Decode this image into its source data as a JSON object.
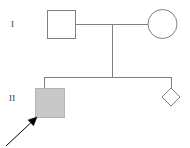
{
  "figure": {
    "kind": "pedigree-chart",
    "width": 190,
    "height": 148,
    "background_color": "#ffffff"
  },
  "style": {
    "line_color": "#808080",
    "line_width": 1,
    "symbol_fill_unaffected": "#ffffff",
    "symbol_fill_affected": "#c8c8c8",
    "arrow_color": "#000000",
    "label_color": "#3a3a3a"
  },
  "generations": [
    {
      "id": "I",
      "label": "I",
      "label_x": 14,
      "label_y": 25,
      "members": [
        {
          "id": "I-1",
          "name": "father-square",
          "shape": "square",
          "sex": "male",
          "affected": false,
          "x": 47,
          "y": 10,
          "size": 28
        },
        {
          "id": "I-2",
          "name": "mother-circle",
          "shape": "circle",
          "sex": "female",
          "affected": false,
          "cx": 162.5,
          "cy": 24,
          "r": 14.5
        }
      ]
    },
    {
      "id": "II",
      "label": "II",
      "label_x": 13,
      "label_y": 99,
      "members": [
        {
          "id": "II-1",
          "name": "proband-square",
          "shape": "square",
          "sex": "male",
          "affected": true,
          "proband": true,
          "x": 35,
          "y": 88,
          "size": 29
        },
        {
          "id": "II-2",
          "name": "unknown-sex-diamond",
          "shape": "diamond",
          "sex": "unknown",
          "affected": false,
          "cx": 171,
          "cy": 97,
          "half": 9
        }
      ]
    }
  ],
  "connectors": {
    "mating_line": {
      "x1": 75,
      "y1": 24,
      "x2": 148,
      "y2": 24
    },
    "descent_line": {
      "x1": 112,
      "y1": 24,
      "x2": 112,
      "y2": 77
    },
    "sibship_line": {
      "x1": 44,
      "y1": 77,
      "x2": 171,
      "y2": 77
    },
    "sib_drop_left": {
      "x1": 44,
      "y1": 77,
      "x2": 44,
      "y2": 88
    },
    "sib_drop_right": {
      "x1": 171,
      "y1": 77,
      "x2": 171,
      "y2": 88
    }
  },
  "proband_arrow": {
    "name": "proband-arrow",
    "from_x": 6,
    "from_y": 146,
    "to_x": 37,
    "to_y": 117,
    "points_to": "II-1",
    "color": "#000000"
  }
}
